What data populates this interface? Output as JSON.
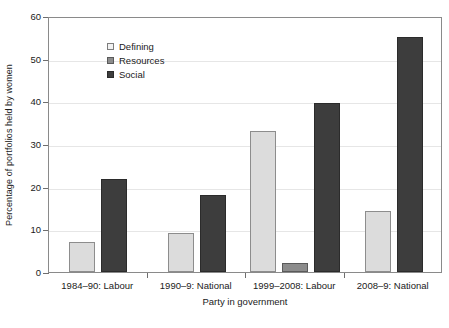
{
  "chart_data": {
    "type": "bar",
    "title": "",
    "subtitle": "",
    "xlabel": "Party in government",
    "ylabel": "Percentage of portfolios held by women",
    "ylim": [
      0,
      60
    ],
    "yticks": [
      0,
      10,
      20,
      30,
      40,
      50,
      60
    ],
    "ytick_labels": [
      "0",
      "10",
      "20",
      "30",
      "40",
      "50",
      "60"
    ],
    "grid": true,
    "legend_position": "top-left",
    "categories": [
      "1984–90: Labour",
      "1990–9: National",
      "1999–2008: Labour",
      "2008–9: National"
    ],
    "series": [
      {
        "name": "Defining",
        "color": "#dcdcdc",
        "values": [
          7.0,
          9.2,
          33.0,
          14.3
        ]
      },
      {
        "name": "Resources",
        "color": "#8c8c8c",
        "values": [
          0,
          0,
          2.0,
          0
        ]
      },
      {
        "name": "Social",
        "color": "#3d3d3d",
        "values": [
          21.7,
          18.0,
          39.5,
          55.0
        ]
      }
    ],
    "colors": {
      "defining": "#dcdcdc",
      "resources": "#8c8c8c",
      "social": "#3d3d3d",
      "gridline": "#e6e6e6",
      "axis": "#8a8a8a",
      "text": "#1a1a1a",
      "background": "#ffffff"
    }
  },
  "legend": {
    "items": [
      {
        "label": "Defining"
      },
      {
        "label": "Resources"
      },
      {
        "label": "Social"
      }
    ]
  }
}
